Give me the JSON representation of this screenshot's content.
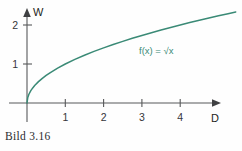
{
  "figure": {
    "caption": "Bild 3.16",
    "background_color": "#fefefe",
    "axis_color": "#57585a",
    "curve_color": "#3a8a76",
    "label_color": "#35363a"
  },
  "chart_data": {
    "type": "line",
    "title": "",
    "subtitle": "",
    "xlabel": "D",
    "ylabel": "W",
    "function_label": "f(x) = √x",
    "function_label_color": "#3a8a76",
    "xlim": [
      -0.25,
      5.6
    ],
    "ylim": [
      -0.35,
      2.55
    ],
    "xticks": [
      1,
      2,
      3,
      4
    ],
    "xtick_labels": [
      "1",
      "2",
      "3",
      "4"
    ],
    "yticks": [
      1,
      2
    ],
    "ytick_labels": [
      "1",
      "2"
    ],
    "grid": false,
    "legend": "none",
    "axis_arrows": true,
    "series": [
      {
        "name": "f(x) = √x",
        "color": "#3a8a76",
        "x": [
          0,
          0.02,
          0.05,
          0.1,
          0.15,
          0.2,
          0.3,
          0.4,
          0.5,
          0.6,
          0.8,
          1.0,
          1.25,
          1.5,
          1.75,
          2.0,
          2.25,
          2.5,
          2.75,
          3.0,
          3.25,
          3.5,
          3.75,
          4.0,
          4.25,
          4.5,
          4.75,
          5.0,
          5.25,
          5.45
        ],
        "y": [
          0,
          0.141,
          0.224,
          0.316,
          0.387,
          0.447,
          0.548,
          0.632,
          0.707,
          0.775,
          0.894,
          1.0,
          1.118,
          1.225,
          1.323,
          1.414,
          1.5,
          1.581,
          1.658,
          1.732,
          1.803,
          1.871,
          1.936,
          2.0,
          2.062,
          2.121,
          2.179,
          2.236,
          2.291,
          2.334
        ]
      }
    ]
  }
}
